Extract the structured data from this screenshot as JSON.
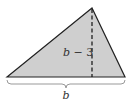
{
  "diagram": {
    "shape": "triangle",
    "fill_color": "#cfcfcf",
    "stroke_color": "#222222",
    "height_label_var": "b",
    "height_label_rest": " − 3",
    "base_label": "b"
  }
}
